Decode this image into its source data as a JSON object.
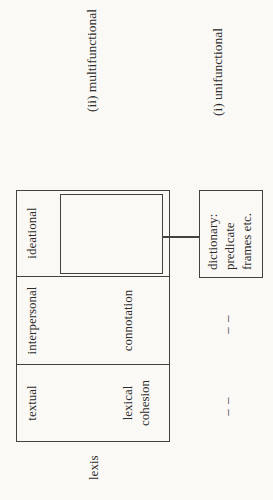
{
  "figure": {
    "lexis_label": "lexis",
    "columns": [
      {
        "header": "textual",
        "sublabel": "lexical\ncohesion"
      },
      {
        "header": "interpersonal",
        "sublabel": "connotation"
      },
      {
        "header": "ideational",
        "sublabel": "denotation"
      }
    ],
    "dictionary_box": {
      "lines": [
        "dictionary:",
        "predicate",
        "frames etc."
      ]
    },
    "placeholders": [
      {
        "column": "textual",
        "mark": "– –"
      },
      {
        "column": "interpersonal",
        "mark": "– –"
      }
    ],
    "annotations": {
      "multifunctional_label": "(ii) multifunctional",
      "unifunctional_label": "(i) unifunctional"
    }
  },
  "colors": {
    "background": "#faf9f6",
    "ink": "#2c2b29",
    "line": "#44423e"
  }
}
